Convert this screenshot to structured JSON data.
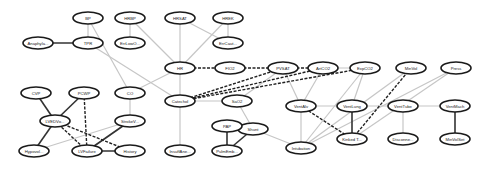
{
  "diagram": {
    "type": "bayesian-network",
    "nodes": [
      {
        "id": "BP",
        "label": "BP",
        "x": 88,
        "y": 18
      },
      {
        "id": "HRBP",
        "label": "HRBP",
        "x": 130,
        "y": 18
      },
      {
        "id": "HRSAT",
        "label": "HRSAT",
        "x": 180,
        "y": 18
      },
      {
        "id": "HREK",
        "label": "HREK",
        "x": 228,
        "y": 18
      },
      {
        "id": "Anaphylaxis",
        "label": "Anaphyla...",
        "x": 38,
        "y": 43
      },
      {
        "id": "TPR",
        "label": "TPR",
        "x": 88,
        "y": 43
      },
      {
        "id": "ErrLowOutput",
        "label": "ErrLowO...",
        "x": 130,
        "y": 43
      },
      {
        "id": "ErrCauter",
        "label": "ErrCaut...",
        "x": 228,
        "y": 43
      },
      {
        "id": "HR",
        "label": "HR",
        "x": 180,
        "y": 68
      },
      {
        "id": "PVSAT",
        "label": "PVSAT",
        "x": 230,
        "y": 68
      },
      {
        "id": "FIO2",
        "label": "FIO2",
        "x": 230,
        "y": 68
      },
      {
        "id": "ArtCO2",
        "label": "ArtCO2",
        "x": 323,
        "y": 68
      },
      {
        "id": "ExpCO2",
        "label": "ExpCO2",
        "x": 365,
        "y": 68
      },
      {
        "id": "MinVol",
        "label": "MinVol",
        "x": 411,
        "y": 68
      },
      {
        "id": "Press",
        "label": "Press",
        "x": 456,
        "y": 68
      },
      {
        "id": "CO",
        "label": "CO",
        "x": 130,
        "y": 93
      },
      {
        "id": "Catechol",
        "label": "Catechol",
        "x": 180,
        "y": 101
      },
      {
        "id": "SaO2",
        "label": "SaO2",
        "x": 237,
        "y": 101
      },
      {
        "id": "VentAlv",
        "label": "VentAlv",
        "x": 301,
        "y": 106
      },
      {
        "id": "VentLung",
        "label": "VentLung",
        "x": 352,
        "y": 106
      },
      {
        "id": "VentTube",
        "label": "VentTube",
        "x": 403,
        "y": 106
      },
      {
        "id": "VentMach",
        "label": "VentMach",
        "x": 455,
        "y": 106
      },
      {
        "id": "Shunt",
        "label": "Shunt",
        "x": 253,
        "y": 129
      },
      {
        "id": "PAP",
        "label": "PAP",
        "x": 227,
        "y": 126
      },
      {
        "id": "KinkedTube",
        "label": "Kinked T...",
        "x": 352,
        "y": 139
      },
      {
        "id": "Disconnect",
        "label": "Disconne...",
        "x": 403,
        "y": 139
      },
      {
        "id": "MinVolSet",
        "label": "MinVolSet",
        "x": 455,
        "y": 139
      },
      {
        "id": "Intubation",
        "label": "Intubation",
        "x": 301,
        "y": 148
      },
      {
        "id": "InsuffAnesth",
        "label": "InsuffAne...",
        "x": 180,
        "y": 151
      },
      {
        "id": "PulmEmbolus",
        "label": "PulmEmb...",
        "x": 227,
        "y": 151
      },
      {
        "id": "CVP",
        "label": "CVP",
        "x": 36,
        "y": 93
      },
      {
        "id": "PCWP",
        "label": "PCWP",
        "x": 84,
        "y": 93
      },
      {
        "id": "LVEDVolume",
        "label": "LVEDVo...",
        "x": 55,
        "y": 121
      },
      {
        "id": "StrokeVolume",
        "label": "StrokeV...",
        "x": 130,
        "y": 121
      },
      {
        "id": "Hypovolemia",
        "label": "Hypovol...",
        "x": 34,
        "y": 151
      },
      {
        "id": "LVFailure",
        "label": "LVFailure",
        "x": 87,
        "y": 151
      },
      {
        "id": "History",
        "label": "History",
        "x": 130,
        "y": 151
      }
    ]
  }
}
